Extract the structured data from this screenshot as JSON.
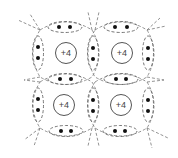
{
  "diagram": {
    "title": "",
    "colors": {
      "line": "#666666",
      "nucleus_stroke": "#555555",
      "electron": "#111111",
      "background": "#ffffff"
    },
    "atoms": [
      {
        "id": "atom-top-left",
        "label": "+4",
        "cx": 66,
        "cy": 53
      },
      {
        "id": "atom-top-right",
        "label": "+4",
        "cx": 122,
        "cy": 53
      },
      {
        "id": "atom-bottom-left",
        "label": "+4",
        "cx": 64,
        "cy": 105
      },
      {
        "id": "atom-bottom-right",
        "label": "+4",
        "cx": 121,
        "cy": 105
      }
    ],
    "bonds": [
      {
        "id": "bond-top-left-outer",
        "orientation": "horizontal",
        "cx": 65,
        "cy": 27,
        "electrons": [
          [
            59,
            27
          ],
          [
            70,
            27
          ]
        ]
      },
      {
        "id": "bond-top-right-outer",
        "orientation": "horizontal",
        "cx": 121,
        "cy": 27,
        "electrons": [
          [
            115,
            27
          ],
          [
            127,
            27
          ]
        ]
      },
      {
        "id": "bond-middle-left",
        "orientation": "horizontal",
        "cx": 65,
        "cy": 79,
        "electrons": [
          [
            60,
            79
          ],
          [
            71,
            79
          ]
        ]
      },
      {
        "id": "bond-middle-right",
        "orientation": "horizontal",
        "cx": 121,
        "cy": 79,
        "electrons": [
          [
            116,
            79
          ],
          [
            126,
            79
          ]
        ]
      },
      {
        "id": "bond-bottom-left-outer",
        "orientation": "horizontal",
        "cx": 66,
        "cy": 131,
        "electrons": [
          [
            61,
            131
          ],
          [
            71,
            131
          ]
        ]
      },
      {
        "id": "bond-bottom-right-outer",
        "orientation": "horizontal",
        "cx": 120,
        "cy": 131,
        "electrons": [
          [
            115,
            131
          ],
          [
            125,
            131
          ]
        ]
      },
      {
        "id": "bond-left-upper-outer",
        "orientation": "vertical",
        "cx": 38,
        "cy": 53,
        "electrons": [
          [
            38,
            47
          ],
          [
            38,
            58
          ]
        ]
      },
      {
        "id": "bond-left-lower-outer",
        "orientation": "vertical",
        "cx": 38,
        "cy": 105,
        "electrons": [
          [
            38,
            99
          ],
          [
            38,
            110
          ]
        ]
      },
      {
        "id": "bond-center-upper",
        "orientation": "vertical",
        "cx": 93,
        "cy": 53,
        "electrons": [
          [
            93,
            48
          ],
          [
            93,
            59
          ]
        ]
      },
      {
        "id": "bond-center-lower",
        "orientation": "vertical",
        "cx": 93,
        "cy": 105,
        "electrons": [
          [
            93,
            100
          ],
          [
            93,
            111
          ]
        ]
      },
      {
        "id": "bond-right-upper-outer",
        "orientation": "vertical",
        "cx": 148,
        "cy": 53,
        "electrons": [
          [
            148,
            48
          ],
          [
            148,
            59
          ]
        ]
      },
      {
        "id": "bond-right-lower-outer",
        "orientation": "vertical",
        "cx": 148,
        "cy": 105,
        "electrons": [
          [
            148,
            100
          ],
          [
            148,
            111
          ]
        ]
      }
    ]
  }
}
